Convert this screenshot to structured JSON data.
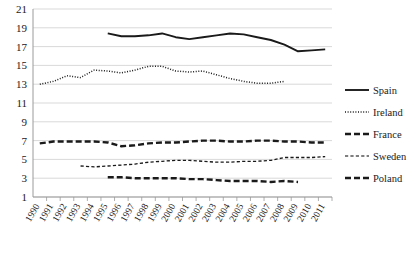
{
  "chart_data": {
    "type": "line",
    "title": "",
    "subtitle": "",
    "xlabel": "",
    "ylabel": "",
    "grid": "horizontal",
    "legend_position": "right",
    "ylim": [
      1,
      21
    ],
    "ytick_step": 2,
    "yticks": [
      "1",
      "3",
      "5",
      "7",
      "9",
      "11",
      "13",
      "15",
      "17",
      "19",
      "21"
    ],
    "categories": [
      "1990",
      "1991",
      "1992",
      "1993",
      "1994",
      "1995",
      "1996",
      "1997",
      "1998",
      "1999",
      "2000",
      "2001",
      "2002",
      "2003",
      "2004",
      "2005",
      "2006",
      "2007",
      "2008",
      "2009",
      "2010",
      "2011"
    ],
    "series": [
      {
        "name": "Spain",
        "style": "solid",
        "color": "#1a1a1a",
        "values": [
          null,
          null,
          null,
          null,
          null,
          18.4,
          18.1,
          18.1,
          18.2,
          18.4,
          18.0,
          17.8,
          18.0,
          18.2,
          18.4,
          18.3,
          18.0,
          17.7,
          17.2,
          16.5,
          16.6,
          16.7
        ]
      },
      {
        "name": "Ireland",
        "style": "dotted",
        "color": "#1a1a1a",
        "values": [
          13.0,
          13.3,
          13.9,
          13.7,
          14.5,
          14.4,
          14.2,
          14.5,
          14.9,
          14.9,
          14.4,
          14.3,
          14.4,
          14.0,
          13.6,
          13.3,
          13.1,
          13.1,
          13.3,
          null,
          null,
          null
        ]
      },
      {
        "name": "France",
        "style": "dashed",
        "color": "#1a1a1a",
        "values": [
          6.7,
          6.9,
          6.9,
          6.9,
          6.9,
          6.8,
          6.4,
          6.5,
          6.7,
          6.8,
          6.8,
          6.9,
          7.0,
          7.0,
          6.9,
          6.9,
          7.0,
          7.0,
          6.9,
          6.9,
          6.8,
          6.8
        ]
      },
      {
        "name": "Sweden",
        "style": "fine-dashed",
        "color": "#555555",
        "values": [
          null,
          null,
          null,
          4.3,
          4.2,
          4.3,
          4.4,
          4.5,
          4.7,
          4.8,
          4.9,
          4.9,
          4.8,
          4.7,
          4.7,
          4.8,
          4.8,
          4.9,
          5.2,
          5.2,
          5.2,
          5.3
        ]
      },
      {
        "name": "Poland",
        "style": "dashed",
        "color": "#1a1a1a",
        "values": [
          null,
          null,
          null,
          null,
          null,
          3.1,
          3.1,
          3.0,
          3.0,
          3.0,
          3.0,
          2.9,
          2.9,
          2.8,
          2.7,
          2.7,
          2.7,
          2.6,
          2.7,
          2.6,
          null,
          null
        ]
      }
    ]
  },
  "legend": {
    "items": [
      {
        "label": "Spain"
      },
      {
        "label": "Ireland"
      },
      {
        "label": "France"
      },
      {
        "label": "Sweden"
      },
      {
        "label": "Poland"
      }
    ]
  }
}
